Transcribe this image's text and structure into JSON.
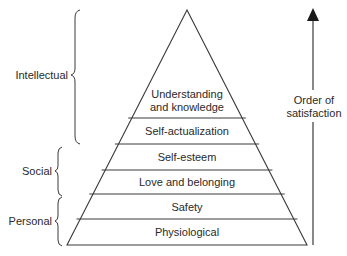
{
  "diagram": {
    "levels": [
      {
        "label_line1": "Understanding",
        "label_line2": "and knowledge"
      },
      {
        "label": "Self-actualization"
      },
      {
        "label": "Self-esteem"
      },
      {
        "label": "Love and belonging"
      },
      {
        "label": "Safety"
      },
      {
        "label": "Physiological"
      }
    ],
    "groups": [
      {
        "label": "Intellectual"
      },
      {
        "label": "Social"
      },
      {
        "label": "Personal"
      }
    ],
    "arrow": {
      "label_line1": "Order of",
      "label_line2": "satisfaction"
    },
    "colors": {
      "line": "#3a3a3a",
      "text": "#2a2a2a",
      "background": "#ffffff"
    }
  }
}
